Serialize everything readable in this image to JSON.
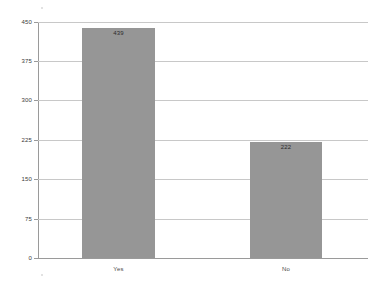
{
  "chart_data": {
    "type": "bar",
    "title": "",
    "subtitle": "",
    "xlabel": "",
    "ylabel": "",
    "categories": [
      "Yes",
      "No"
    ],
    "values": [
      439,
      222
    ],
    "data_labels": [
      "439",
      "222"
    ],
    "ylim": [
      0,
      450
    ],
    "yticks": [
      0,
      75,
      150,
      225,
      300,
      375,
      450
    ],
    "ytick_labels": [
      "0",
      "75",
      "150",
      "225",
      "300",
      "375",
      "450"
    ],
    "grid": true,
    "grid_orientation": "horizontal",
    "legend": false,
    "legend_position": "none",
    "series": [
      {
        "name": "",
        "values": [
          439,
          222
        ]
      }
    ]
  },
  "style": {
    "bar_color": "#969696",
    "grid_color": "#c8c8c8",
    "axis_color": "#9a9a9a",
    "label_color": "#3a3a3a",
    "value_label_color": "#2b2b2b",
    "background": "#ffffff"
  }
}
